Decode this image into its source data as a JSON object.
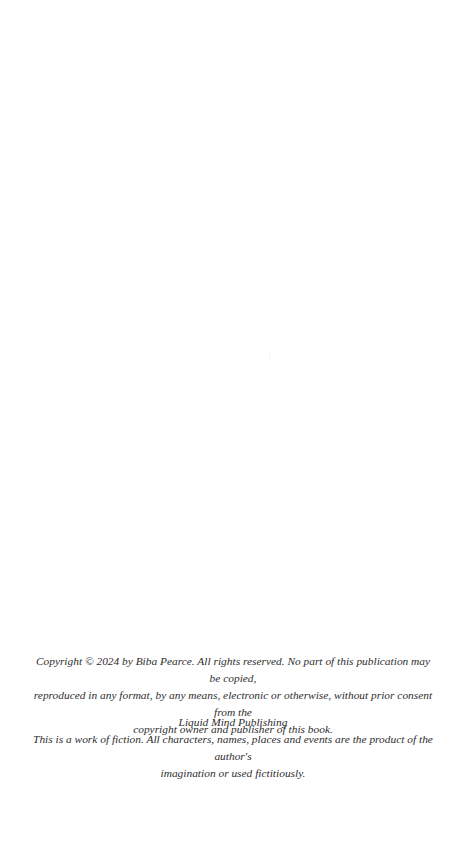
{
  "page": {
    "background": "#ffffff",
    "text_color": "#2e2e2e"
  },
  "copyright": {
    "notice_lines": [
      "Copyright © 2024 by Biba Pearce. All rights reserved. No part of this publication may be copied,",
      "reproduced in any format, by any means, electronic or otherwise, without prior consent from the",
      "copyright owner and publisher of this book."
    ],
    "publisher": "Liquid Mind Publishing",
    "fiction_lines": [
      "This is a work of fiction. All characters, names, places and events are the product of the author's",
      "imagination or used fictitiously."
    ]
  }
}
